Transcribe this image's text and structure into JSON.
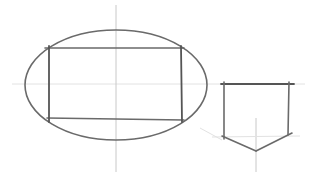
{
  "canvas": {
    "width": 316,
    "height": 181,
    "background": "#ffffff"
  },
  "colors": {
    "stroke": "#6a6a6a",
    "stroke_dark": "#555555",
    "guide": "#e2e2e2",
    "center_line": "#c8c8c8"
  },
  "shapes": {
    "ellipse": {
      "cx": 116,
      "cy": 85,
      "rx": 91,
      "ry": 55
    },
    "inscribed_rectangle": {
      "x1": 49,
      "y1": 48,
      "x2": 182,
      "y2": 120
    },
    "pentagon": {
      "points": [
        [
          224,
          84
        ],
        [
          289,
          84
        ],
        [
          289,
          134
        ],
        [
          256,
          150
        ],
        [
          224,
          137
        ]
      ]
    }
  },
  "guides": {
    "horizontal_y": 84,
    "ellipse_vertical_x": 116,
    "pentagon_vertical_x": 256
  }
}
